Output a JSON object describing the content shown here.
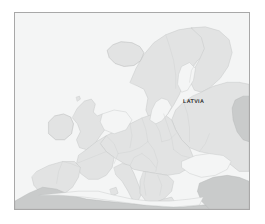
{
  "figure": {
    "kind": "political-map",
    "region": "Europe",
    "frame": {
      "border_color": "#a8a8a8",
      "page_background": "#ffffff"
    }
  },
  "map": {
    "sea_color": "#f4f5f5",
    "land_color": "#e2e3e3",
    "land_highlight_color": "#ededee",
    "land_dark_color": "#c9cbcb",
    "border_color": "#cfd1d1",
    "coast_color": "#b9bbbb",
    "labels": [
      {
        "id": "latvia",
        "text": "LATVIA",
        "color": "#2c2c2c"
      }
    ]
  }
}
